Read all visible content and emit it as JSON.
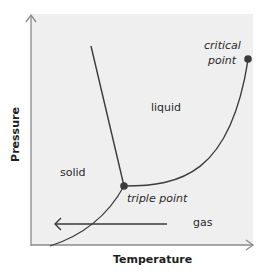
{
  "diagram": {
    "type": "phase-diagram",
    "axes": {
      "x_label": "Temperature",
      "y_label": "Pressure"
    },
    "regions": {
      "solid": "solid",
      "liquid": "liquid",
      "gas": "gas"
    },
    "points": {
      "triple": "triple point",
      "critical_line1": "critical",
      "critical_line2": "point"
    },
    "colors": {
      "background": "#efefef",
      "line": "#3a3a3a",
      "axis": "#8a8a8a",
      "point": "#3a3a3a"
    }
  }
}
